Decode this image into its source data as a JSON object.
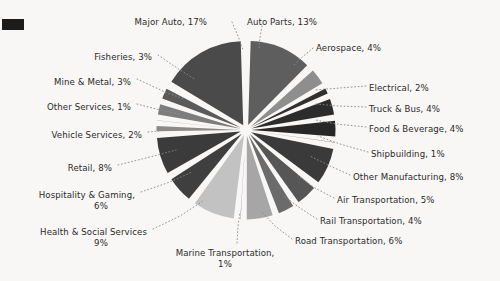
{
  "chart_data": {
    "type": "pie",
    "title": "",
    "subtitle": "",
    "xlabel": "",
    "ylabel": "",
    "legend_position": "none",
    "grid": false,
    "value_unit": "%",
    "total": 100,
    "start_angle_deg": 90,
    "direction": "counter-clockwise-for-major-auto",
    "exploded": true,
    "categories": [
      "Major Auto",
      "Fisheries",
      "Mine & Metal",
      "Other Services",
      "Vehicle Services",
      "Retail",
      "Hospitality & Gaming",
      "Health & Social Services",
      "Marine Transportation",
      "Road Transportation",
      "Rail Transportation",
      "Air Transportation",
      "Other Manufacturing",
      "Shipbuilding",
      "Food & Beverage",
      "Truck & Bus",
      "Electrical",
      "Aerospace",
      "Auto Parts"
    ],
    "values": [
      17,
      3,
      3,
      1,
      2,
      8,
      6,
      9,
      1,
      6,
      4,
      5,
      8,
      1,
      4,
      4,
      2,
      4,
      13
    ],
    "colors": [
      "#4a4a4a",
      "#5a5a5a",
      "#7d7d7d",
      "#8c8c8c",
      "#8a8a8a",
      "#3b3b3b",
      "#3f3f3f",
      "#c2c2c2",
      "#4d4d4d",
      "#a6a6a6",
      "#6b6b6b",
      "#565656",
      "#3a3a3a",
      "#2e2e2e",
      "#272727",
      "#2c2c2c",
      "#303030",
      "#8e8e8e",
      "#5e5e5e"
    ],
    "slices": [
      {
        "label": "Major Auto, 17%",
        "name": "Major Auto",
        "value": 17,
        "color": "#4a4a4a"
      },
      {
        "label": "Fisheries, 3%",
        "name": "Fisheries",
        "value": 3,
        "color": "#5a5a5a"
      },
      {
        "label": "Mine & Metal, 3%",
        "name": "Mine & Metal",
        "value": 3,
        "color": "#7d7d7d"
      },
      {
        "label": "Other Services, 1%",
        "name": "Other Services",
        "value": 1,
        "color": "#8c8c8c"
      },
      {
        "label": "Vehicle Services, 2%",
        "name": "Vehicle Services",
        "value": 2,
        "color": "#8a8a8a"
      },
      {
        "label": "Retail, 8%",
        "name": "Retail",
        "value": 8,
        "color": "#3b3b3b"
      },
      {
        "label": "Hospitality & Gaming,\n6%",
        "name": "Hospitality & Gaming",
        "value": 6,
        "color": "#3f3f3f"
      },
      {
        "label": "Health & Social Services\n9%",
        "name": "Health & Social Services",
        "value": 9,
        "color": "#c2c2c2"
      },
      {
        "label": "Marine Transportation,\n1%",
        "name": "Marine Transportation",
        "value": 1,
        "color": "#4d4d4d"
      },
      {
        "label": "Road Transportation, 6%",
        "name": "Road Transportation",
        "value": 6,
        "color": "#a6a6a6"
      },
      {
        "label": "Rail Transportation, 4%",
        "name": "Rail Transportation",
        "value": 4,
        "color": "#6b6b6b"
      },
      {
        "label": "Air Transportation, 5%",
        "name": "Air Transportation",
        "value": 5,
        "color": "#565656"
      },
      {
        "label": "Other Manufacturing, 8%",
        "name": "Other Manufacturing",
        "value": 8,
        "color": "#3a3a3a"
      },
      {
        "label": "Shipbuilding, 1%",
        "name": "Shipbuilding",
        "value": 1,
        "color": "#2e2e2e"
      },
      {
        "label": "Food & Beverage, 4%",
        "name": "Food & Beverage",
        "value": 4,
        "color": "#272727"
      },
      {
        "label": "Truck & Bus, 4%",
        "name": "Truck & Bus",
        "value": 4,
        "color": "#2c2c2c"
      },
      {
        "label": "Electrical, 2%",
        "name": "Electrical",
        "value": 2,
        "color": "#303030"
      },
      {
        "label": "Aerospace, 4%",
        "name": "Aerospace",
        "value": 4,
        "color": "#8e8e8e"
      },
      {
        "label": "Auto Parts, 13%",
        "name": "Auto Parts",
        "value": 13,
        "color": "#5e5e5e"
      }
    ]
  },
  "labels": [
    {
      "key": "major_auto",
      "text": "Major Auto, 17%",
      "x": 207,
      "y": 17,
      "align": "r"
    },
    {
      "key": "auto_parts",
      "text": "Auto Parts, 13%",
      "x": 247,
      "y": 17,
      "align": "l"
    },
    {
      "key": "aerospace",
      "text": "Aerospace, 4%",
      "x": 316,
      "y": 43,
      "align": "l"
    },
    {
      "key": "fisheries",
      "text": "Fisheries, 3%",
      "x": 152,
      "y": 52,
      "align": "r"
    },
    {
      "key": "mine_metal",
      "text": "Mine & Metal, 3%",
      "x": 131,
      "y": 77,
      "align": "r"
    },
    {
      "key": "electrical",
      "text": "Electrical, 2%",
      "x": 369,
      "y": 83,
      "align": "l"
    },
    {
      "key": "truck_bus",
      "text": "Truck & Bus, 4%",
      "x": 369,
      "y": 104,
      "align": "l"
    },
    {
      "key": "other_services",
      "text": "Other Services, 1%",
      "x": 131,
      "y": 102,
      "align": "r"
    },
    {
      "key": "food_bev",
      "text": "Food & Beverage, 4%",
      "x": 369,
      "y": 124,
      "align": "l"
    },
    {
      "key": "vehicle_svc",
      "text": "Vehicle Services, 2%",
      "x": 142,
      "y": 130,
      "align": "r"
    },
    {
      "key": "shipbuilding",
      "text": "Shipbuilding, 1%",
      "x": 371,
      "y": 149,
      "align": "l"
    },
    {
      "key": "retail",
      "text": "Retail, 8%",
      "x": 112,
      "y": 163,
      "align": "r"
    },
    {
      "key": "other_mfg",
      "text": "Other Manufacturing, 8%",
      "x": 353,
      "y": 172,
      "align": "l"
    },
    {
      "key": "hospitality",
      "text": "Hospitality & Gaming,",
      "x": 135,
      "y": 190,
      "align": "r"
    },
    {
      "key": "hospitality2",
      "text": "6%",
      "x": 101,
      "y": 201,
      "align": "c"
    },
    {
      "key": "air_trans",
      "text": "Air Transportation, 5%",
      "x": 337,
      "y": 195,
      "align": "l"
    },
    {
      "key": "rail_trans",
      "text": "Rail Transportation, 4%",
      "x": 320,
      "y": 216,
      "align": "l"
    },
    {
      "key": "health",
      "text": "Health & Social Services",
      "x": 147,
      "y": 227,
      "align": "r"
    },
    {
      "key": "health2",
      "text": "9%",
      "x": 101,
      "y": 238,
      "align": "c"
    },
    {
      "key": "road_trans",
      "text": "Road Transportation, 6%",
      "x": 295,
      "y": 236,
      "align": "l"
    },
    {
      "key": "marine",
      "text": "Marine Transportation,",
      "x": 225,
      "y": 248,
      "align": "c"
    },
    {
      "key": "marine2",
      "text": "1%",
      "x": 225,
      "y": 259,
      "align": "c"
    }
  ],
  "geometry": {
    "center_x": 246,
    "center_y": 130,
    "radius": 84,
    "explode_offset": 5.5,
    "gap_deg": 3.4
  },
  "leaders": [
    {
      "key": "major_auto",
      "pts": "232,22 238,36 243,50"
    },
    {
      "key": "auto_parts",
      "pts": "262,26 260,38 259,50"
    },
    {
      "key": "aerospace",
      "pts": "313,48 300,59 294,65"
    },
    {
      "key": "fisheries",
      "pts": "158,55 180,70 196,80"
    },
    {
      "key": "mine_metal",
      "pts": "137,79 165,92 184,99"
    },
    {
      "key": "electrical",
      "pts": "366,86 340,88 314,90"
    },
    {
      "key": "truck_bus",
      "pts": "366,107 338,106 316,104"
    },
    {
      "key": "other_services",
      "text_side": "l",
      "pts": "137,104 160,110 180,114"
    },
    {
      "key": "food_bev",
      "pts": "366,127 336,124 316,120"
    },
    {
      "key": "vehicle_svc",
      "pts": "148,132 168,130 183,129"
    },
    {
      "key": "shipbuilding",
      "pts": "368,152 340,144 318,136"
    },
    {
      "key": "retail",
      "pts": "118,165 150,157 176,150"
    },
    {
      "key": "other_mfg",
      "pts": "350,175 330,166 310,156"
    },
    {
      "key": "hospitality",
      "pts": "141,192 170,182 192,172"
    },
    {
      "key": "air_trans",
      "pts": "334,198 315,188 298,176"
    },
    {
      "key": "rail_trans",
      "pts": "317,219 300,208 284,196"
    },
    {
      "key": "health",
      "pts": "153,229 180,216 203,201"
    },
    {
      "key": "road_trans",
      "pts": "292,239 275,226 262,212"
    },
    {
      "key": "marine",
      "pts": "237,243 238,226 240,212"
    }
  ]
}
